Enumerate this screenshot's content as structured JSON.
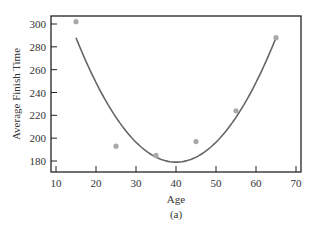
{
  "chart_data": {
    "type": "scatter",
    "title": "",
    "caption": "(a)",
    "xlabel": "Age",
    "ylabel": "Average Finish Time",
    "xlim": [
      9,
      71
    ],
    "ylim": [
      170,
      306
    ],
    "xticks": [
      10,
      20,
      30,
      40,
      50,
      60,
      70
    ],
    "yticks": [
      180,
      200,
      220,
      240,
      260,
      280,
      300
    ],
    "grid": false,
    "legend": null,
    "series": [
      {
        "name": "observed",
        "kind": "scatter",
        "x": [
          15,
          25,
          35,
          45,
          55,
          65
        ],
        "y": [
          302,
          193,
          185,
          197,
          224,
          288
        ],
        "color": "#a8a8a8"
      },
      {
        "name": "quadratic fit",
        "kind": "line",
        "equation": "y = 179 + 0.1744*(x-40)^2",
        "x_range": [
          15,
          65
        ],
        "vertex": [
          40,
          179
        ],
        "color": "#666666"
      }
    ]
  },
  "colors": {
    "frame": "#222222",
    "curve": "#666666",
    "points": "#a8a8a8",
    "text": "#333333"
  }
}
